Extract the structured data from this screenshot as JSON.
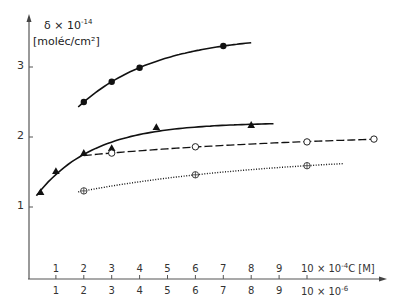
{
  "chart_data": {
    "type": "scatter",
    "title": "",
    "ylabel_line1": "δ × 10",
    "ylabel_exp": "-14",
    "ylabel_line2": "[moléc/cm²]",
    "xlabel_upper_prefix": "10 × 10",
    "xlabel_upper_exp": "-4",
    "xlabel_upper_suffix": "C [M]",
    "xlabel_lower_prefix": "10 × 10",
    "xlabel_lower_exp": "-6",
    "x_ticks_upper": [
      "1",
      "2",
      "3",
      "4",
      "5",
      "6",
      "7",
      "8",
      "9"
    ],
    "x_ticks_lower": [
      "1",
      "2",
      "3",
      "4",
      "5",
      "6",
      "7",
      "8",
      "9"
    ],
    "y_ticks": [
      "1",
      "2",
      "3"
    ],
    "xlim": [
      0,
      13.3
    ],
    "ylim": [
      0,
      3.8
    ],
    "grid": false,
    "legend": "none",
    "series": [
      {
        "name": "filled circles",
        "marker": "filled-circle",
        "line": "solid",
        "x": [
          2.0,
          3.0,
          4.0,
          7.0
        ],
        "y": [
          2.5,
          2.79,
          2.99,
          3.3
        ],
        "curve_x_range": [
          1.8,
          8.0
        ]
      },
      {
        "name": "filled triangles",
        "marker": "filled-triangle",
        "line": "solid",
        "x": [
          0.45,
          1.0,
          2.0,
          3.0,
          4.6,
          8.0
        ],
        "y": [
          1.21,
          1.51,
          1.77,
          1.84,
          2.14,
          2.17
        ],
        "curve_x_range": [
          0.3,
          8.8
        ]
      },
      {
        "name": "open circles",
        "marker": "open-circle",
        "line": "dashed",
        "x": [
          3.0,
          6.0,
          10.0,
          12.4
        ],
        "y": [
          1.77,
          1.86,
          1.93,
          1.97
        ],
        "curve_x_range": [
          2.0,
          12.5
        ]
      },
      {
        "name": "crossed circles",
        "marker": "crossed-circle",
        "line": "dotted",
        "x": [
          2.0,
          6.0,
          10.0
        ],
        "y": [
          1.23,
          1.46,
          1.59
        ],
        "curve_x_range": [
          1.8,
          11.3
        ]
      }
    ]
  }
}
